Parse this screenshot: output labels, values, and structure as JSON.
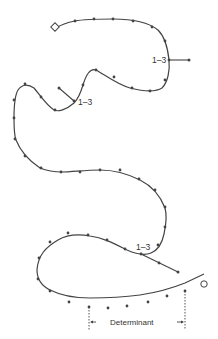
{
  "diagram": {
    "type": "path-trajectory",
    "start_marker": "diamond",
    "end_marker": "circle",
    "branch_labels": [
      {
        "id": "branch-1",
        "text": "1–3"
      },
      {
        "id": "branch-2",
        "text": "1–3"
      },
      {
        "id": "branch-3",
        "text": "1–3"
      }
    ],
    "dimension_label": "Determinant",
    "colors": {
      "line": "#444444",
      "dots": "#444444",
      "text": "#333333",
      "background": "#ffffff"
    }
  }
}
